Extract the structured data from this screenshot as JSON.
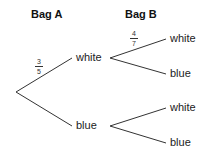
{
  "headers": {
    "bag_a": "Bag A",
    "bag_b": "Bag B"
  },
  "level1": {
    "white": {
      "label": "white",
      "prob_num": "3",
      "prob_den": "5"
    },
    "blue": {
      "label": "blue"
    }
  },
  "level2": {
    "white_white": {
      "label": "white",
      "prob_num": "4",
      "prob_den": "7"
    },
    "white_blue": {
      "label": "blue"
    },
    "blue_white": {
      "label": "white"
    },
    "blue_blue": {
      "label": "blue"
    }
  },
  "colors": {
    "line": "#333333",
    "background": "#ffffff"
  }
}
